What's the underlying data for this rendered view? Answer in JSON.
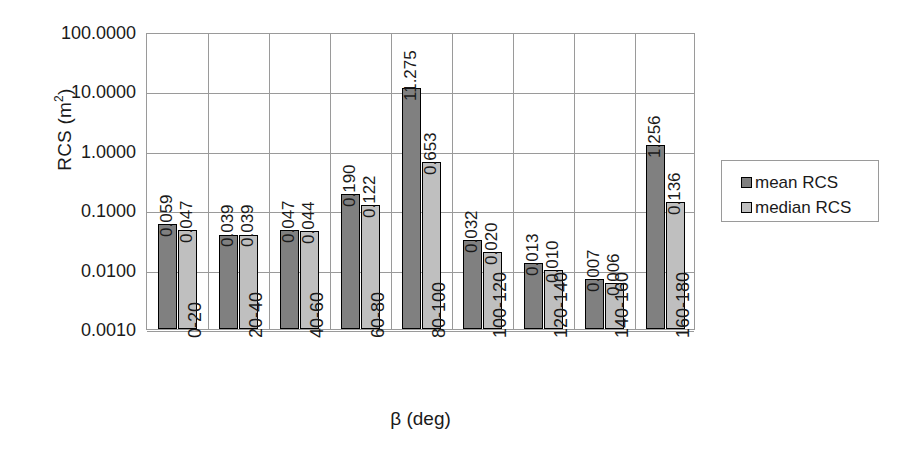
{
  "chart_data": {
    "type": "bar",
    "title": "",
    "xlabel": "β (deg)",
    "ylabel": "RCS (m²)",
    "yscale": "log",
    "ylim": [
      0.001,
      100.0
    ],
    "ytick_labels": [
      "100.0000",
      "10.0000",
      "1.0000",
      "0.1000",
      "0.0100",
      "0.0010"
    ],
    "ytick_values": [
      100.0,
      10.0,
      1.0,
      0.1,
      0.01,
      0.001
    ],
    "grid": true,
    "legend_position": "right",
    "categories": [
      "0-20",
      "20-40",
      "40-60",
      "60-80",
      "80-100",
      "100-120",
      "120-140",
      "140-160",
      "160-180"
    ],
    "series": [
      {
        "name": "mean RCS",
        "color": "#808080",
        "values": [
          0.059,
          0.039,
          0.047,
          0.19,
          11.275,
          0.032,
          0.013,
          0.007,
          1.256
        ],
        "labels": [
          "0.059",
          "0.039",
          "0.047",
          "0.190",
          "11.275",
          "0.032",
          "0.013",
          "0.007",
          "1.256"
        ]
      },
      {
        "name": "median RCS",
        "color": "#bfbfbf",
        "values": [
          0.047,
          0.039,
          0.044,
          0.122,
          0.653,
          0.02,
          0.01,
          0.006,
          0.136
        ],
        "labels": [
          "0.047",
          "0.039",
          "0.044",
          "0.122",
          "0.653",
          "0.020",
          "0.010",
          "0.006",
          "0.136"
        ]
      }
    ]
  },
  "axes": {
    "y_title_main": "RCS (m",
    "y_title_sup": "2",
    "y_title_tail": ")",
    "x_title": "β (deg)"
  },
  "legend": {
    "entries": [
      {
        "label": "mean RCS",
        "color": "#808080"
      },
      {
        "label": "median RCS",
        "color": "#bfbfbf"
      }
    ]
  }
}
